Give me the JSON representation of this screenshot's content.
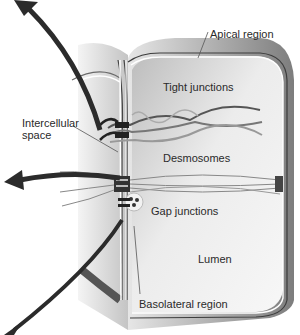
{
  "diagram": {
    "type": "epithelial cell junctions illustration",
    "labels": {
      "apical_region": "Apical region",
      "tight_junctions": "Tight junctions",
      "intercellular_space_line1": "Intercellular",
      "intercellular_space_line2": "space",
      "desmosomes": "Desmosomes",
      "gap_junctions": "Gap junctions",
      "lumen": "Lumen",
      "basolateral_region": "Basolateral region"
    },
    "colors": {
      "cell_body": "#d9d9d9",
      "cell_shadow": "#8a8a8a",
      "membrane": "#4a4a4a",
      "arrow": "#2b2b2b",
      "text": "#2a2a2a"
    }
  }
}
